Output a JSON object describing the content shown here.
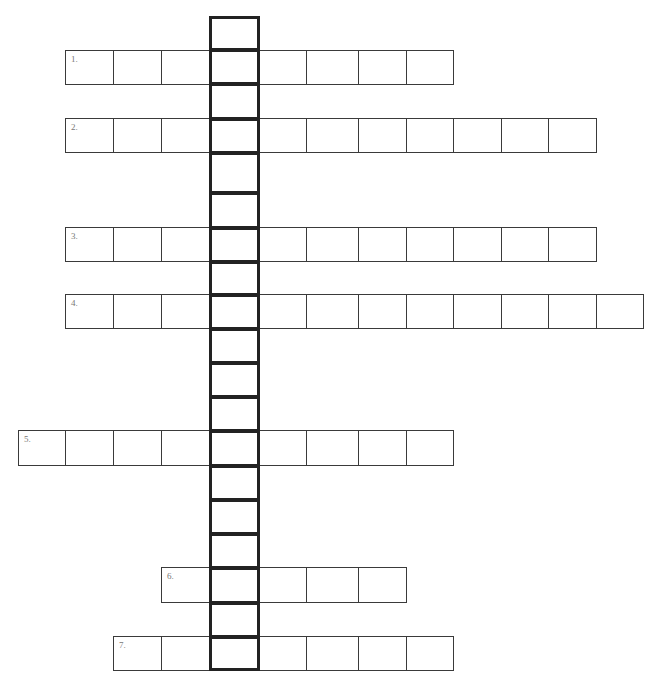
{
  "puzzle": {
    "type": "crossword-vertical-keyword",
    "vertical_column": {
      "x": 209,
      "width": 50,
      "row_edges": [
        16,
        49,
        83,
        118,
        152,
        192,
        227,
        261,
        294,
        328,
        362,
        396,
        430,
        465,
        499,
        533,
        567,
        602,
        636,
        669
      ],
      "box_count": 19
    },
    "rows": [
      {
        "label": "1.",
        "top": 50,
        "height": 34,
        "x_edges": [
          65,
          113,
          161,
          209,
          259,
          306,
          358,
          406,
          453
        ]
      },
      {
        "label": "2.",
        "top": 118,
        "height": 34,
        "x_edges": [
          65,
          113,
          161,
          209,
          259,
          306,
          358,
          406,
          453,
          501,
          548,
          596
        ]
      },
      {
        "label": "3.",
        "top": 227,
        "height": 34,
        "x_edges": [
          65,
          113,
          161,
          209,
          259,
          306,
          358,
          406,
          453,
          501,
          548,
          596
        ]
      },
      {
        "label": "4.",
        "top": 294,
        "height": 34,
        "x_edges": [
          65,
          113,
          161,
          209,
          259,
          306,
          358,
          406,
          453,
          501,
          548,
          596,
          643
        ]
      },
      {
        "label": "5.",
        "top": 430,
        "height": 35,
        "x_edges": [
          18,
          65,
          113,
          161,
          209,
          259,
          306,
          358,
          406,
          453
        ]
      },
      {
        "label": "6.",
        "top": 567,
        "height": 35,
        "x_edges": [
          161,
          209,
          259,
          306,
          358,
          406
        ]
      },
      {
        "label": "7.",
        "top": 636,
        "height": 34,
        "x_edges": [
          113,
          161,
          209,
          259,
          306,
          358,
          406,
          453
        ]
      }
    ]
  },
  "colors": {
    "thin_border": "#3a3a3a",
    "thick_border": "#222222",
    "label": "#777777",
    "background": "#ffffff"
  }
}
